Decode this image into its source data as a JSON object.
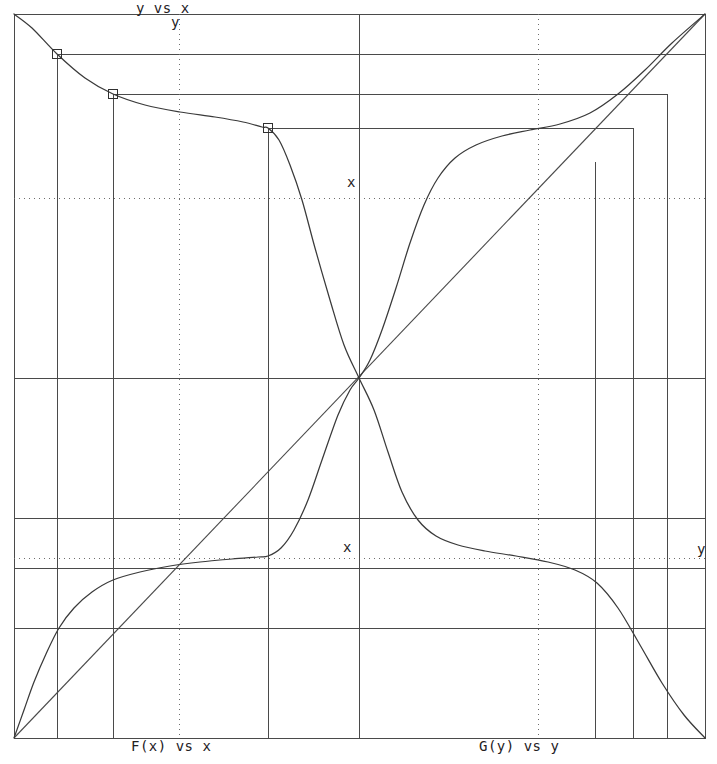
{
  "figure": {
    "title": "y vs x",
    "axis_y_label": "y",
    "x_label_upper": "x",
    "x_label_lower": "x",
    "y_label_right": "y",
    "bottom_left_label": "F(x) vs x",
    "bottom_right_label": "G(y) vs y",
    "line_color": "#3a3a3a",
    "grid_color": "#6d6d6d",
    "frame_color": "#4a4a4a",
    "background": "#ffffff"
  },
  "chart_data": {
    "type": "line",
    "title": "y vs x",
    "xlabel": "x",
    "ylabel": "y",
    "xlim": [
      14,
      705
    ],
    "ylim": [
      738,
      14
    ],
    "grid": true,
    "legend": "none",
    "frame": {
      "left": 14,
      "right": 705,
      "top": 14,
      "bottom": 738
    },
    "center": {
      "x": 359,
      "y": 378
    },
    "axes": {
      "vertical_center_x": 359,
      "horizontal_center_y": 378
    },
    "dotted_gridlines": {
      "vertical_x": [
        179,
        538
      ],
      "horizontal_y": [
        198,
        558
      ]
    },
    "annotations": [
      {
        "text": "y vs x",
        "x": 136,
        "y": 0
      },
      {
        "text": "y",
        "x": 171,
        "y": 14
      },
      {
        "text": "x",
        "x": 347,
        "y": 174
      },
      {
        "text": "x",
        "x": 343,
        "y": 539
      },
      {
        "text": "y",
        "x": 697,
        "y": 541
      },
      {
        "text": "F(x) vs x",
        "x": 131,
        "y": 738
      },
      {
        "text": "G(y) vs y",
        "x": 479,
        "y": 738
      }
    ],
    "series": [
      {
        "name": "descending-sigmoid",
        "comment": "decreasing curve from top-left corner through center to bottom-right corner",
        "points": [
          [
            14,
            14
          ],
          [
            32,
            28
          ],
          [
            57,
            54
          ],
          [
            85,
            78
          ],
          [
            113,
            94
          ],
          [
            145,
            105
          ],
          [
            180,
            112
          ],
          [
            215,
            117
          ],
          [
            243,
            122
          ],
          [
            262,
            127
          ],
          [
            268,
            128
          ],
          [
            279,
            140
          ],
          [
            290,
            165
          ],
          [
            302,
            200
          ],
          [
            315,
            248
          ],
          [
            330,
            300
          ],
          [
            344,
            345
          ],
          [
            359,
            378
          ],
          [
            374,
            410
          ],
          [
            388,
            452
          ],
          [
            402,
            492
          ],
          [
            418,
            520
          ],
          [
            436,
            536
          ],
          [
            458,
            545
          ],
          [
            485,
            551
          ],
          [
            516,
            556
          ],
          [
            548,
            562
          ],
          [
            575,
            570
          ],
          [
            597,
            583
          ],
          [
            618,
            608
          ],
          [
            640,
            645
          ],
          [
            662,
            683
          ],
          [
            684,
            715
          ],
          [
            705,
            738
          ]
        ]
      },
      {
        "name": "ascending-sigmoid",
        "comment": "increasing mirrored curve from bottom-left corner through center to top-right corner",
        "points": [
          [
            14,
            738
          ],
          [
            24,
            710
          ],
          [
            34,
            682
          ],
          [
            46,
            654
          ],
          [
            59,
            628
          ],
          [
            74,
            608
          ],
          [
            92,
            592
          ],
          [
            113,
            580
          ],
          [
            140,
            572
          ],
          [
            170,
            566
          ],
          [
            200,
            562
          ],
          [
            232,
            559
          ],
          [
            258,
            557
          ],
          [
            268,
            556
          ],
          [
            281,
            548
          ],
          [
            294,
            530
          ],
          [
            308,
            500
          ],
          [
            322,
            460
          ],
          [
            338,
            415
          ],
          [
            350,
            390
          ],
          [
            359,
            378
          ],
          [
            370,
            360
          ],
          [
            382,
            330
          ],
          [
            396,
            288
          ],
          [
            410,
            243
          ],
          [
            424,
            205
          ],
          [
            438,
            178
          ],
          [
            455,
            158
          ],
          [
            476,
            145
          ],
          [
            502,
            136
          ],
          [
            530,
            130
          ],
          [
            560,
            124
          ],
          [
            590,
            113
          ],
          [
            618,
            94
          ],
          [
            645,
            70
          ],
          [
            672,
            43
          ],
          [
            705,
            14
          ]
        ]
      }
    ],
    "identity_line": {
      "from": [
        359,
        378
      ],
      "to": [
        705,
        14
      ]
    },
    "identity_line_full": {
      "from": [
        14,
        738
      ],
      "to": [
        705,
        14
      ]
    },
    "markers": [
      {
        "shape": "square",
        "x": 57,
        "y": 54,
        "size": 9
      },
      {
        "shape": "square",
        "x": 113,
        "y": 94,
        "size": 9
      },
      {
        "shape": "square",
        "x": 268,
        "y": 128,
        "size": 9
      }
    ],
    "lead_lines": {
      "comment": "construction lines linking markers to mirrored axes",
      "horizontal_top": [
        {
          "y": 54,
          "x1": 57,
          "x2": 705
        },
        {
          "y": 94,
          "x1": 113,
          "x2": 667
        },
        {
          "y": 128,
          "x1": 268,
          "x2": 633
        }
      ],
      "vertical_left": [
        {
          "x": 57,
          "y1": 54,
          "y2": 738
        },
        {
          "x": 113,
          "y1": 94,
          "y2": 738
        },
        {
          "x": 268,
          "y1": 128,
          "y2": 738
        }
      ],
      "vertical_right": [
        {
          "x": 705,
          "y1": 14,
          "y2": 738
        },
        {
          "x": 667,
          "y1": 94,
          "y2": 738
        },
        {
          "x": 633,
          "y1": 128,
          "y2": 738
        },
        {
          "x": 595,
          "y1": 162,
          "y2": 738
        }
      ],
      "horizontal_bottom": [
        {
          "y": 628,
          "x1": 14,
          "x2": 705
        },
        {
          "y": 568,
          "x1": 14,
          "x2": 705
        },
        {
          "y": 518,
          "x1": 14,
          "x2": 705
        }
      ]
    }
  }
}
